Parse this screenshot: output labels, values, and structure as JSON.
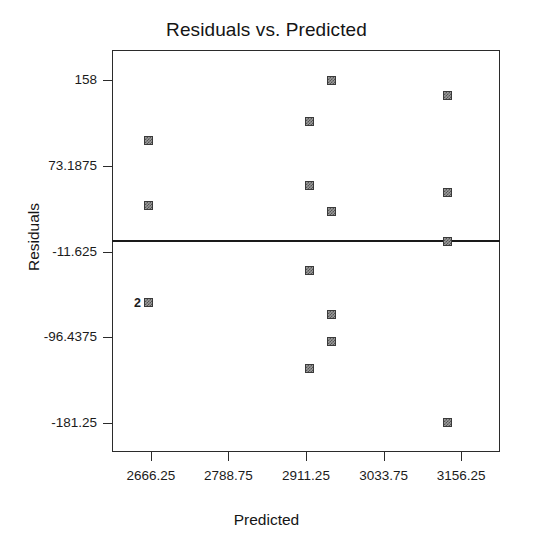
{
  "chart_data": {
    "type": "scatter",
    "title": "Residuals vs. Predicted",
    "xlabel": "Predicted",
    "ylabel": "Residuals",
    "xlim": [
      2605.0,
      3217.5
    ],
    "ylim": [
      -210.0,
      188.0
    ],
    "xticks": [
      2666.25,
      2788.75,
      2911.25,
      3033.75,
      3156.25
    ],
    "xtick_labels": [
      "2666.25",
      "2788.75",
      "2911.25",
      "3033.75",
      "3156.25"
    ],
    "yticks": [
      158,
      73.1875,
      -11.625,
      -96.4375,
      -181.25
    ],
    "ytick_labels": [
      "158",
      "73.1875",
      "-11.625",
      "-96.4375",
      "-181.25"
    ],
    "grid": false,
    "legend": null,
    "reference_line": {
      "orientation": "horizontal",
      "y": 0,
      "label": ""
    },
    "points": [
      {
        "x": 2662.0,
        "y": 98.0,
        "label": ""
      },
      {
        "x": 2662.0,
        "y": 34.0,
        "label": ""
      },
      {
        "x": 2662.0,
        "y": -62.0,
        "label": "2"
      },
      {
        "x": 2916.0,
        "y": 117.0,
        "label": ""
      },
      {
        "x": 2916.0,
        "y": 54.0,
        "label": ""
      },
      {
        "x": 2916.0,
        "y": -30.0,
        "label": ""
      },
      {
        "x": 2916.0,
        "y": -127.0,
        "label": ""
      },
      {
        "x": 2952.0,
        "y": 158.0,
        "label": ""
      },
      {
        "x": 2952.0,
        "y": 28.0,
        "label": ""
      },
      {
        "x": 2952.0,
        "y": -74.0,
        "label": ""
      },
      {
        "x": 2952.0,
        "y": -101.0,
        "label": ""
      },
      {
        "x": 3135.0,
        "y": 143.0,
        "label": ""
      },
      {
        "x": 3135.0,
        "y": 47.0,
        "label": ""
      },
      {
        "x": 3135.0,
        "y": -2.0,
        "label": ""
      },
      {
        "x": 3135.0,
        "y": -181.25,
        "label": ""
      }
    ]
  },
  "style": {
    "marker_color": "#9a9a9a",
    "marker_edge_color": "#3a3a3a",
    "axis_color": "#2b2b2b",
    "text_color": "#1b1b1b",
    "background": "#ffffff"
  }
}
